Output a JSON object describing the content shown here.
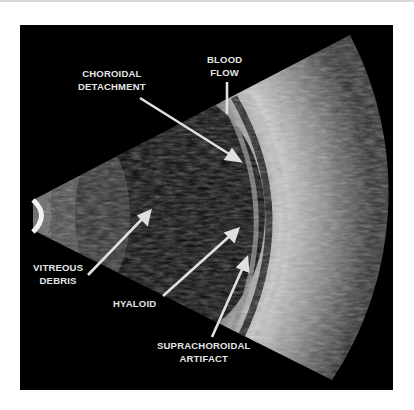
{
  "figure": {
    "labels": {
      "choroidal_detachment": {
        "line1": "CHOROIDAL",
        "line2": "DETACHMENT"
      },
      "blood_flow": {
        "line1": "BLOOD",
        "line2": "FLOW"
      },
      "vitreous_debris": {
        "line1": "VITREOUS",
        "line2": "DEBRIS"
      },
      "hyaloid": {
        "line1": "HYALOID"
      },
      "suprachoroidal_artifact": {
        "line1": "SUPRACHOROIDAL",
        "line2": "ARTIFACT"
      }
    },
    "colors": {
      "background": "#000000",
      "label": "#e6e6e6",
      "arrow": "#e0e0e0",
      "page": "#ffffff"
    }
  }
}
